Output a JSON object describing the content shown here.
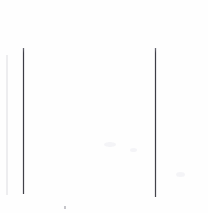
{
  "document": {
    "kind": "scanned-page-fragment",
    "width": 208,
    "height": 213,
    "background_color": "#fefefe",
    "content_text": "",
    "description": "Blank scanned page region containing two thin vertical rules and faint scan noise"
  },
  "marks": {
    "left_rule": {
      "name": "left vertical rule",
      "color": "#3a3a42",
      "x": 23,
      "y_top": 48,
      "y_bottom": 194,
      "thickness_px": 1
    },
    "right_rule": {
      "name": "right vertical rule",
      "color": "#3b3b43",
      "x": 155,
      "y_top": 48,
      "y_bottom": 197,
      "thickness_px": 1
    },
    "speck": {
      "name": "scanner speck",
      "color": "#96969e",
      "x": 64,
      "y": 206
    },
    "edge_smudge": {
      "name": "left edge smudge",
      "color": "#c8c8ce",
      "x": 6,
      "y_top": 55,
      "y_bottom": 195
    }
  }
}
